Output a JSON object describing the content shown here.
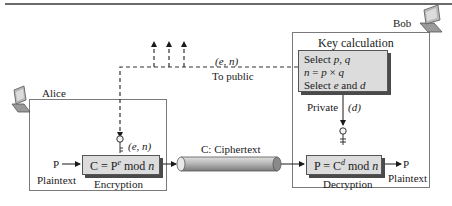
{
  "parties": {
    "alice": {
      "label": "Alice"
    },
    "bob": {
      "label": "Bob"
    }
  },
  "public_channel": {
    "key_label": "(e, n)",
    "caption": "To public"
  },
  "key_calculation": {
    "title": "Key calculation",
    "lines": [
      "Select p, q",
      "n = p × q",
      "Select e and d"
    ]
  },
  "private_key": {
    "label": "Private",
    "key": "(d)"
  },
  "encryption": {
    "input_symbol": "P",
    "input_label": "Plaintext",
    "key_label": "(e, n)",
    "formula": "C = P^e mod n",
    "formula_parts": {
      "lhs": "C = P",
      "exp": "e",
      "rhs": " mod ",
      "mod": "n"
    },
    "caption": "Encryption"
  },
  "channel": {
    "label": "C: Ciphertext"
  },
  "decryption": {
    "formula": "P = C^d mod n",
    "formula_parts": {
      "lhs": "P = C",
      "exp": "d",
      "rhs": " mod ",
      "mod": "n"
    },
    "caption": "Decryption",
    "output_symbol": "P",
    "output_label": "Plaintext"
  },
  "colors": {
    "box_fill": "#dcdcdc",
    "border": "#7a7a7a",
    "shadow": "#4a4a4a",
    "pipe": "#a8a8a8"
  }
}
